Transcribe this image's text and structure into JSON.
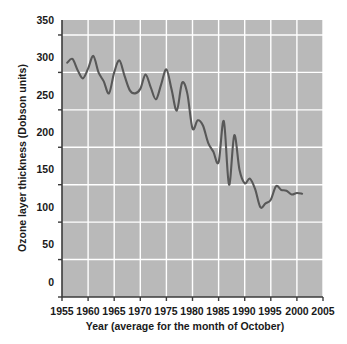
{
  "chart_data": {
    "type": "line",
    "title": "",
    "subtitle": "",
    "xlabel": "Year (average for the month of October)",
    "ylabel": "Ozone layer thickness (Dobson units)",
    "xlim": [
      1955,
      2005
    ],
    "ylim": [
      0,
      370
    ],
    "xticks": [
      1955,
      1960,
      1965,
      1970,
      1975,
      1980,
      1985,
      1990,
      1995,
      2000,
      2005
    ],
    "yticks": [
      0,
      50,
      100,
      150,
      200,
      250,
      300,
      350
    ],
    "grid": true,
    "legend": null,
    "series_name": "Ozone layer thickness",
    "line_color": "#585858",
    "plot_background": "#b9b9b9",
    "grid_color": "#ffffff",
    "x": [
      1956,
      1957,
      1958,
      1959,
      1960,
      1961,
      1962,
      1963,
      1964,
      1965,
      1966,
      1967,
      1968,
      1969,
      1970,
      1971,
      1972,
      1973,
      1974,
      1975,
      1976,
      1977,
      1978,
      1979,
      1980,
      1981,
      1982,
      1983,
      1984,
      1985,
      1986,
      1987,
      1988,
      1989,
      1990,
      1991,
      1992,
      1993,
      1994,
      1995,
      1996,
      1997,
      1998,
      1999,
      2000,
      2001
    ],
    "values": [
      313,
      318,
      303,
      292,
      305,
      322,
      300,
      288,
      272,
      300,
      316,
      295,
      276,
      272,
      278,
      297,
      280,
      264,
      284,
      304,
      277,
      249,
      286,
      272,
      225,
      236,
      229,
      206,
      194,
      180,
      235,
      150,
      216,
      170,
      152,
      158,
      144,
      120,
      125,
      130,
      148,
      143,
      142,
      137,
      139,
      138
    ]
  }
}
